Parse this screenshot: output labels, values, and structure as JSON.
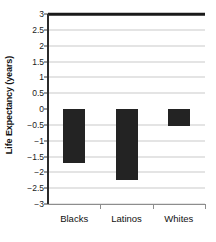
{
  "chart_data": {
    "type": "bar",
    "title": "",
    "xlabel": "",
    "ylabel": "Life Expectancy (years)",
    "categories": [
      "Blacks",
      "Latinos",
      "Whites"
    ],
    "values": [
      -1.7,
      -2.25,
      -0.55
    ],
    "series": [
      {
        "name": "Change in life expectancy",
        "values": [
          -1.7,
          -2.25,
          -0.55
        ]
      }
    ],
    "ylim": [
      -3,
      3
    ],
    "ytick_step": 0.5,
    "ytick_labels": [
      "3",
      "2.5",
      "2",
      "1.5",
      "1",
      "0.5",
      "0",
      "−0.5",
      "−1",
      "−1.5",
      "−2",
      "−2.5",
      "−3"
    ],
    "ytick_values": [
      3,
      2.5,
      2,
      1.5,
      1,
      0.5,
      0,
      -0.5,
      -1,
      -1.5,
      -2,
      -2.5,
      -3
    ],
    "grid": true,
    "legend": false,
    "legend_position": "none",
    "bar_color": "#232323",
    "gridline_color": "#c9c9c9",
    "axis_color": "#2b2b2b",
    "zero_line_color": "#1a1a1a",
    "background_color": "#ffffff"
  }
}
